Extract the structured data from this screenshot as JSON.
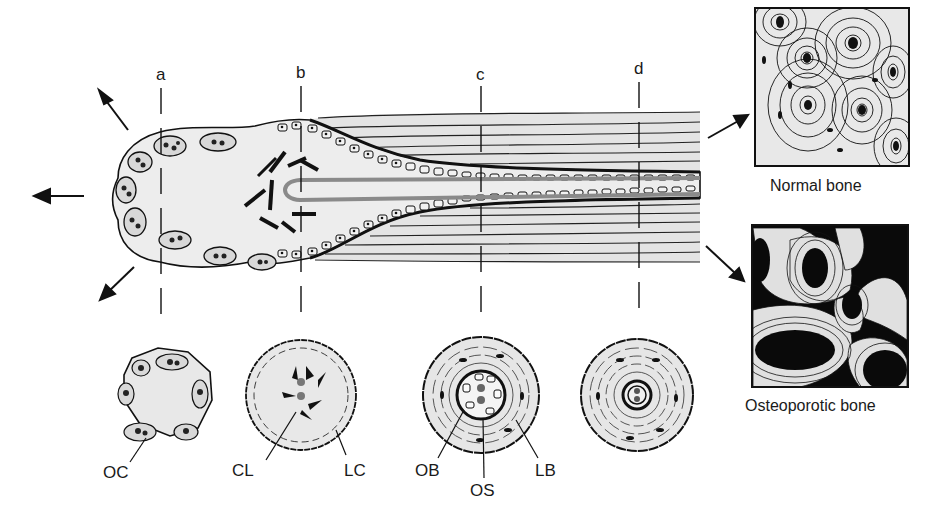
{
  "figure": {
    "section_labels": [
      "a",
      "b",
      "c",
      "d"
    ],
    "cross_section_labels": {
      "oc": "OC",
      "cl": "CL",
      "lc": "LC",
      "ob": "OB",
      "os": "OS",
      "lb": "LB"
    },
    "panels": {
      "normal": "Normal bone",
      "osteoporotic": "Osteoporotic bone"
    },
    "colors": {
      "fill": "#e8e8e8",
      "ink": "#111111",
      "vessel": "#8a8a8a",
      "osteoporotic_bg": "#0a0a0a"
    }
  }
}
